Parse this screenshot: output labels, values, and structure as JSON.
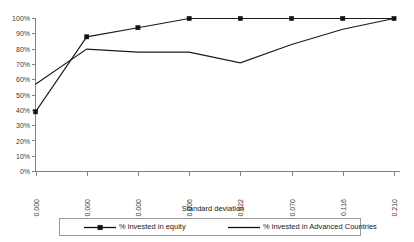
{
  "chart_data": {
    "type": "line",
    "title": "",
    "xlabel": "Standard deviation",
    "ylabel": "",
    "categories": [
      "0.000",
      "0.000",
      "0.000",
      "0.006",
      "0.022",
      "0.070",
      "0.116",
      "0.210"
    ],
    "ylim": [
      0,
      100
    ],
    "ytick_labels": [
      "100%",
      "90%",
      "80%",
      "70%",
      "60%",
      "50%",
      "40%",
      "30%",
      "20%",
      "10%",
      "0%"
    ],
    "ytick_values": [
      100,
      90,
      80,
      70,
      60,
      50,
      40,
      30,
      20,
      10,
      0
    ],
    "grid": false,
    "legend_position": "bottom",
    "series": [
      {
        "name": "% invested in equity",
        "values": [
          39,
          88,
          94,
          100,
          100,
          100,
          100,
          100
        ],
        "markers": true,
        "color": "#111111"
      },
      {
        "name": "% invested in Advanced Countries",
        "values": [
          57,
          80,
          78,
          78,
          71,
          83,
          93,
          100
        ],
        "markers": false,
        "color": "#111111"
      }
    ]
  },
  "legend": {
    "items": [
      {
        "label": "% invested in equity",
        "marker": true
      },
      {
        "label": "% invested in Advanced Countries",
        "marker": false
      }
    ]
  },
  "axis": {
    "x_title": "Standard deviation"
  }
}
